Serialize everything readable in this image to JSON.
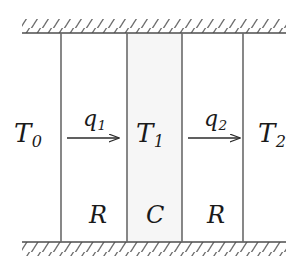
{
  "figure": {
    "kind": "thermal-rc-network-schematic",
    "width": 298,
    "height": 271,
    "background_color": "#ffffff",
    "line_color": "#555555",
    "text_color": "#1a1a1a",
    "shaded_color": "#f6f6f6"
  },
  "labels": {
    "T0": {
      "base": "T",
      "sub": "0"
    },
    "T1": {
      "base": "T",
      "sub": "1"
    },
    "T2": {
      "base": "T",
      "sub": "2"
    },
    "q1": {
      "base": "q",
      "sub": "1"
    },
    "q2": {
      "base": "q",
      "sub": "2"
    },
    "R_left": "R",
    "C": "C",
    "R_right": "R"
  },
  "diagram_data": {
    "type": "schematic",
    "description": "One-dimensional thermal resistance-capacitance wall model between two hatched boundary surfaces",
    "boundaries": [
      {
        "name": "top-hatched-boundary",
        "y": 33,
        "x_start": 22,
        "x_end": 286,
        "hatch_direction": "up-right",
        "hatch_side": "above"
      },
      {
        "name": "bottom-hatched-boundary",
        "y": 242,
        "x_start": 22,
        "x_end": 286,
        "hatch_direction": "up-right",
        "hatch_side": "below"
      }
    ],
    "vertical_walls": [
      {
        "name": "wall-left-outer",
        "x": 61,
        "y_top": 33,
        "y_bottom": 242
      },
      {
        "name": "wall-capacitor-left",
        "x": 127,
        "y_top": 33,
        "y_bottom": 242
      },
      {
        "name": "wall-capacitor-right",
        "x": 182,
        "y_top": 33,
        "y_bottom": 242
      },
      {
        "name": "wall-right-outer",
        "x": 243,
        "y_top": 33,
        "y_bottom": 242
      }
    ],
    "shaded_region": {
      "name": "capacitance-layer",
      "x_start": 127,
      "x_end": 182,
      "y_start": 33,
      "y_end": 242
    },
    "heat_flux_arrows": [
      {
        "name": "q1",
        "x_start": 67,
        "x_end": 122,
        "y": 138,
        "direction": "right"
      },
      {
        "name": "q2",
        "x_start": 188,
        "x_end": 243,
        "y": 138,
        "direction": "right"
      }
    ],
    "nodes": [
      {
        "label": "T0",
        "meaning": "outside temperature",
        "x": 30
      },
      {
        "label": "T1",
        "meaning": "wall core temperature",
        "x": 152
      },
      {
        "label": "T2",
        "meaning": "inside temperature",
        "x": 272
      }
    ],
    "elements": [
      {
        "label": "R",
        "meaning": "thermal resistance",
        "x": 95
      },
      {
        "label": "C",
        "meaning": "thermal capacitance",
        "x": 154
      },
      {
        "label": "R",
        "meaning": "thermal resistance",
        "x": 214
      }
    ]
  }
}
